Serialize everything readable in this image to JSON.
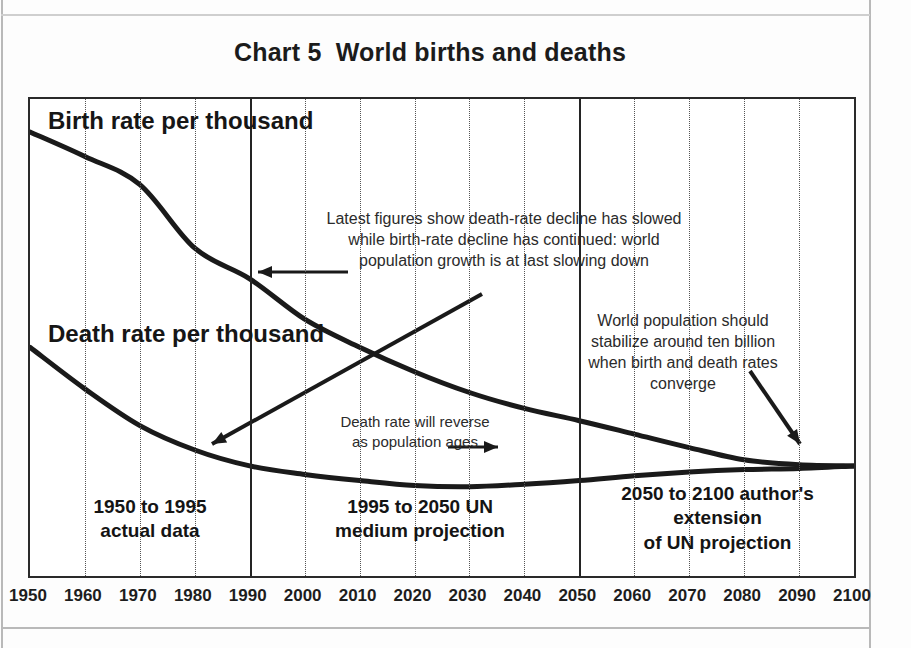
{
  "title": "Chart 5  World births and deaths",
  "series_labels": {
    "birth": "Birth rate per thousand",
    "death": "Death rate per thousand"
  },
  "annotations": {
    "top": "Latest figures show death-rate decline has slowed\nwhile birth-rate decline has continued: world\npopulation growth is at last slowing down",
    "right": "World population should\nstabilize around ten billion\nwhen birth and death rates\nconverge",
    "death_reverse": "Death rate will reverse\nas population ages"
  },
  "zones": {
    "zone1": "1950 to 1995\nactual data",
    "zone2": "1995 to 2050 UN\nmedium projection",
    "zone3": "2050 to 2100 author's\nextension\nof UN projection"
  },
  "dividers": [
    1990,
    2050
  ],
  "colors": {
    "line": "#1a1a1a",
    "axis": "#2a2a2a",
    "grid": "#555555",
    "text": "#1b1b1b"
  },
  "chart_data": {
    "type": "line",
    "title": "Chart 5  World births and deaths",
    "xlabel": "",
    "ylabel": "",
    "xlim": [
      1950,
      2100
    ],
    "ylim": [
      1.5,
      40.5
    ],
    "grid": true,
    "legend": "inline labels on curves",
    "x": [
      1950,
      1960,
      1970,
      1980,
      1990,
      2000,
      2010,
      2020,
      2030,
      2040,
      2050,
      2060,
      2070,
      2080,
      2090,
      2100
    ],
    "xticks": [
      "1950",
      "1960",
      "1970",
      "1980",
      "1990",
      "2000",
      "2010",
      "2020",
      "2030",
      "2040",
      "2050",
      "2060",
      "2070",
      "2080",
      "2090",
      "2100"
    ],
    "yticks": [
      39,
      36,
      33,
      30,
      27,
      24,
      21,
      18,
      15,
      12,
      9,
      6,
      3
    ],
    "ytick_labels": [
      "9",
      "6",
      "3",
      "0",
      "7",
      "4",
      "1",
      "8",
      "5",
      "2",
      "9",
      "6",
      "3"
    ],
    "ytick_labels_full": [
      "39",
      "36",
      "33",
      "30",
      "27",
      "24",
      "21",
      "18",
      "15",
      "12",
      "9",
      "6",
      "3"
    ],
    "ytick_note": "Left digits are cropped off the scanned page; only the final digit of each label is visible",
    "series": [
      {
        "name": "Birth rate per thousand",
        "values": [
          37.8,
          35.8,
          33.5,
          28.3,
          25.8,
          22.5,
          20.2,
          18.2,
          16.5,
          15.2,
          14.2,
          13.1,
          12.0,
          11.0,
          10.6,
          10.5
        ]
      },
      {
        "name": "Death rate per thousand",
        "values": [
          20.2,
          16.8,
          13.8,
          11.8,
          10.5,
          9.8,
          9.3,
          8.9,
          8.8,
          9.0,
          9.3,
          9.7,
          10.0,
          10.2,
          10.3,
          10.5
        ]
      }
    ]
  }
}
